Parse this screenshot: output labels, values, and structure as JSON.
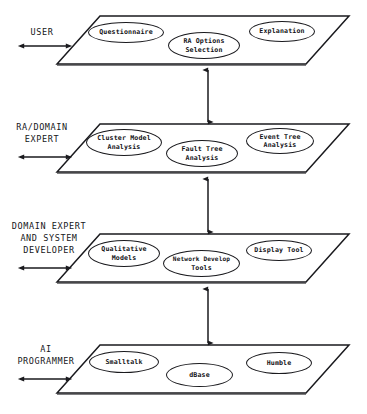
{
  "diagram": {
    "type": "layered-architecture",
    "stroke_color": "#1a1a1e",
    "background_color": "#ffffff",
    "layers": [
      {
        "id": "user-layer",
        "role_label_lines": [
          "USER"
        ],
        "nodes": [
          {
            "id": "questionnaire",
            "label": "Questionnaire",
            "lines": [
              "Questionnaire"
            ],
            "position": "left"
          },
          {
            "id": "ra-options-selection",
            "label": "RA Options Selection",
            "lines": [
              "RA Options",
              "Selection"
            ],
            "position": "center"
          },
          {
            "id": "explanation",
            "label": "Explanation",
            "lines": [
              "Explanation"
            ],
            "position": "right"
          }
        ]
      },
      {
        "id": "ra-domain-expert-layer",
        "role_label_lines": [
          "RA/DOMAIN",
          "EXPERT"
        ],
        "nodes": [
          {
            "id": "cluster-model-analysis",
            "label": "Cluster Model Analysis",
            "lines": [
              "Cluster Model",
              "Analysis"
            ],
            "position": "left"
          },
          {
            "id": "fault-tree-analysis",
            "label": "Fault Tree Analysis",
            "lines": [
              "Fault Tree",
              "Analysis"
            ],
            "position": "center"
          },
          {
            "id": "event-tree-analysis",
            "label": "Event Tree Analysis",
            "lines": [
              "Event Tree",
              "Analysis"
            ],
            "position": "right"
          }
        ]
      },
      {
        "id": "domain-expert-system-developer-layer",
        "role_label_lines": [
          "DOMAIN EXPERT",
          "AND SYSTEM",
          "DEVELOPER"
        ],
        "nodes": [
          {
            "id": "qualitative-models",
            "label": "Qualitative Models",
            "lines": [
              "Qualitative",
              "Models"
            ],
            "position": "left"
          },
          {
            "id": "network-develop-tools",
            "label": "Network Develop Tools",
            "lines": [
              "Network Develop",
              "Tools"
            ],
            "position": "center"
          },
          {
            "id": "display-tool",
            "label": "Display Tool",
            "lines": [
              "Display Tool"
            ],
            "position": "right"
          }
        ]
      },
      {
        "id": "ai-programmer-layer",
        "role_label_lines": [
          "AI",
          "PROGRAMMER"
        ],
        "nodes": [
          {
            "id": "smalltalk",
            "label": "Smalltalk",
            "lines": [
              "Smalltalk"
            ],
            "position": "left"
          },
          {
            "id": "dbase",
            "label": "dBase",
            "lines": [
              "dBase"
            ],
            "position": "center"
          },
          {
            "id": "humble",
            "label": "Humble",
            "lines": [
              "Humble"
            ],
            "position": "right"
          }
        ]
      }
    ],
    "connectors": [
      {
        "id": "connector-user-to-ra",
        "from": "user-layer",
        "to": "ra-domain-expert-layer",
        "style": "double-headed-vertical-arrow"
      },
      {
        "id": "connector-ra-to-domain",
        "from": "ra-domain-expert-layer",
        "to": "domain-expert-system-developer-layer",
        "style": "double-headed-vertical-arrow"
      },
      {
        "id": "connector-domain-to-ai",
        "from": "domain-expert-system-developer-layer",
        "to": "ai-programmer-layer",
        "style": "double-headed-vertical-arrow"
      }
    ],
    "role_arrows": [
      {
        "id": "role-arrow-user",
        "layer": "user-layer",
        "style": "double-headed-horizontal-arrow"
      },
      {
        "id": "role-arrow-ra-domain-expert",
        "layer": "ra-domain-expert-layer",
        "style": "double-headed-horizontal-arrow"
      },
      {
        "id": "role-arrow-domain-expert-system-developer",
        "layer": "domain-expert-system-developer-layer",
        "style": "double-headed-horizontal-arrow"
      },
      {
        "id": "role-arrow-ai-programmer",
        "layer": "ai-programmer-layer",
        "style": "double-headed-horizontal-arrow"
      }
    ]
  }
}
